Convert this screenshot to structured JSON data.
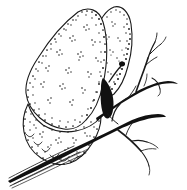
{
  "image": {
    "title": "Butterfly resting on a twig",
    "subject": "butterfly",
    "style": "black-and-white stippled line engraving",
    "medium": "pen and ink / woodcut engraving",
    "orientation": "side profile, wings closed upright",
    "background_color": "#ffffff",
    "ink_color": "#1a1a1a",
    "width_px": 187,
    "height_px": 190
  },
  "subject": {
    "name": "butterfly",
    "pose": "perched with wings held closed above the body",
    "facing": "right",
    "parts": {
      "forewing_label": "forewing",
      "hindwing_label": "hindwing",
      "upper_lobe_label": "upper wing lobe",
      "lower_lobe_label": "lower wing lobe",
      "antenna_label": "clubbed antenna",
      "body_label": "body and legs"
    },
    "wing_pattern": {
      "texture": "dense stippling along wing margins",
      "spots": "scattered clusters of dark dots across wing surface",
      "margin": "scalloped lower hindwing edge",
      "spot_cluster_count": 14
    }
  },
  "perch": {
    "name": "twig",
    "description": "bare forked branch running diagonally from lower left to upper right",
    "main_branch_label": "main branch",
    "twig_labels": [
      "upper right twig",
      "upper right twig fork",
      "mid right twig",
      "lower right twig",
      "lower twig fork",
      "small side shoot"
    ],
    "branch_ends": "tapering to fine points at lower left and right edges",
    "line_count_lower_left": 4
  },
  "palette": {
    "ink": "#1a1a1a",
    "background": "#ffffff",
    "stipple": "#141414",
    "branch": "#111111"
  }
}
